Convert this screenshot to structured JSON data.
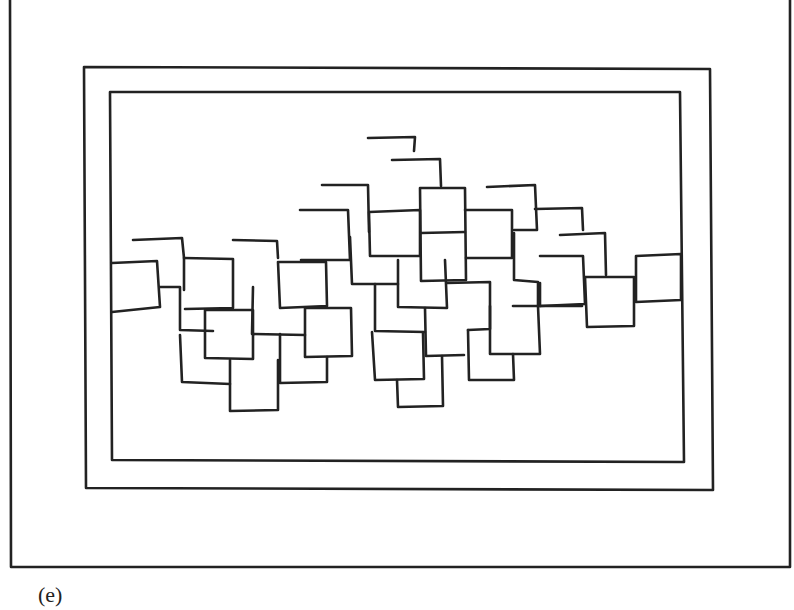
{
  "figure": {
    "caption": "(e)",
    "colors": {
      "ink": "#222222",
      "paper": "#ffffff"
    }
  }
}
